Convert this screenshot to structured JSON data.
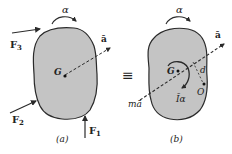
{
  "diagram": {
    "colors": {
      "body_fill": "#c4c4c4",
      "stroke": "#2a2a2a",
      "background": "#ffffff"
    },
    "panel_a": {
      "caption": "(a)",
      "alpha_label": "α",
      "accel_label": "ā",
      "center_label": "G",
      "forces": [
        {
          "name": "F3",
          "label_main": "F",
          "label_sub": "3"
        },
        {
          "name": "F2",
          "label_main": "F",
          "label_sub": "2"
        },
        {
          "name": "F1",
          "label_main": "F",
          "label_sub": "1"
        }
      ]
    },
    "equivalence_symbol": "≡",
    "panel_b": {
      "caption": "(b)",
      "alpha_label": "α",
      "accel_label": "ā",
      "center_label": "G",
      "point_label": "O",
      "distance_label": "d",
      "inertia_moment_label": "Īα",
      "inertia_force_label": "mā"
    }
  }
}
